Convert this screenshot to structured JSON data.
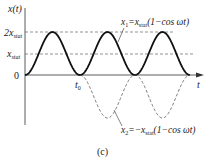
{
  "figure": {
    "caption": "(c)",
    "y_axis_label": "x(t)",
    "x_axis_label": "t",
    "y_ticks": [
      {
        "label": "2x",
        "sub": "stat",
        "value": 2
      },
      {
        "label": "x",
        "sub": "stat",
        "value": 1
      },
      {
        "label": "0",
        "sub": "",
        "value": 0
      }
    ],
    "t0_label": "t",
    "t0_sub": "0",
    "curve1": {
      "name": "x1",
      "lhs": "x",
      "lhs_sub": "1",
      "eq": "=x",
      "eq_sub": "stat",
      "rhs": "(1−cos ωt)",
      "style": "solid"
    },
    "curve2": {
      "name": "x2",
      "lhs": "x",
      "lhs_sub": "2",
      "eq": "=−x",
      "eq_sub": "stat",
      "rhs": "(1−cos ωt)",
      "style": "dashed"
    }
  },
  "chart_data": {
    "type": "line",
    "title": "",
    "xlabel": "t",
    "ylabel": "x(t)",
    "ylim": [
      -2,
      2
    ],
    "y_ticks": [
      "0",
      "x_stat",
      "2x_stat"
    ],
    "grid": false,
    "annotations": [
      "t0",
      "x1 = x_stat(1 − cos ωt)",
      "x2 = −x_stat(1 − cos ωt)"
    ],
    "series": [
      {
        "name": "x1 = x_stat(1 − cos ωt)",
        "style": "solid",
        "x_periods": [
          0,
          0.5,
          1,
          1.5,
          2,
          2.5,
          3
        ],
        "values": [
          0,
          2,
          0,
          2,
          0,
          2,
          0
        ]
      },
      {
        "name": "x2 = −x_stat(1 − cos ωt)",
        "style": "dashed",
        "x_periods": [
          1,
          1.5,
          2,
          2.5,
          3
        ],
        "values": [
          0,
          -2,
          0,
          -2,
          0
        ]
      }
    ]
  }
}
